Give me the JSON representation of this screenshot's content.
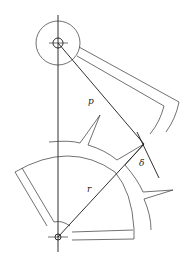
{
  "diagram": {
    "type": "cam-follower-geometry",
    "labels": {
      "p": "p",
      "r": "r",
      "delta": "δ"
    },
    "colors": {
      "line": "#1a1a1a",
      "background": "#ffffff"
    },
    "points": {
      "upper_pivot": [
        58,
        43
      ],
      "lower_pivot": [
        58,
        237
      ],
      "contact_point": [
        144,
        144
      ]
    }
  }
}
